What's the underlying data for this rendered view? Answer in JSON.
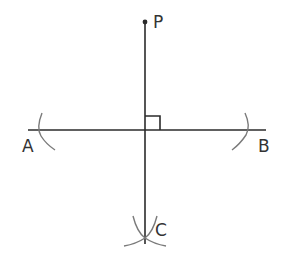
{
  "diagram": {
    "labels": {
      "P": "P",
      "A": "A",
      "B": "B",
      "C": "C"
    },
    "points": {
      "P": {
        "x": 145,
        "y": 22
      },
      "A_end": {
        "x": 28,
        "y": 130
      },
      "B_end": {
        "x": 266,
        "y": 130
      },
      "foot": {
        "x": 145,
        "y": 130
      },
      "C": {
        "x": 145,
        "y": 238
      }
    },
    "elements": [
      "point P",
      "line AB (horizontal)",
      "perpendicular segment from P through foot to C",
      "right-angle marker at intersection",
      "construction arc near A",
      "construction arc near B",
      "two intersecting construction arcs at C"
    ],
    "colors": {
      "line": "#2b2b2b",
      "arc": "#7a7a7a",
      "text": "#333333",
      "background": "#ffffff"
    }
  }
}
